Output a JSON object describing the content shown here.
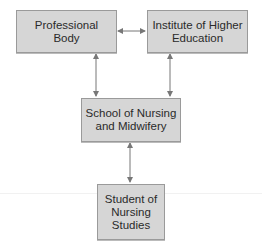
{
  "diagram": {
    "type": "organizational-relationship",
    "nodes": [
      {
        "id": "professional_body",
        "label_line1": "Professional",
        "label_line2": "Body"
      },
      {
        "id": "institute",
        "label_line1": "Institute of Higher",
        "label_line2": "Education"
      },
      {
        "id": "school",
        "label_line1": "School of Nursing",
        "label_line2": "and Midwifery"
      },
      {
        "id": "student",
        "label_line1": "Student of",
        "label_line2": "Nursing",
        "label_line3": "Studies"
      }
    ],
    "edges": [
      {
        "from": "professional_body",
        "to": "institute",
        "style": "bidirectional"
      },
      {
        "from": "professional_body",
        "to": "school",
        "style": "bidirectional"
      },
      {
        "from": "institute",
        "to": "school",
        "style": "bidirectional"
      },
      {
        "from": "school",
        "to": "student",
        "style": "bidirectional"
      }
    ],
    "colors": {
      "box_fill": "#d6d6d6",
      "box_border": "#9a9a9a",
      "arrow": "#777777",
      "text": "#2a2a2a"
    }
  }
}
